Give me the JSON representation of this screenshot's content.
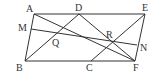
{
  "diagram": {
    "type": "geometry",
    "points": {
      "A": {
        "label": "A",
        "x": 34,
        "y": 14,
        "lx": 26,
        "ly": 12
      },
      "D": {
        "label": "D",
        "x": 79,
        "y": 14,
        "lx": 75,
        "ly": 11
      },
      "E": {
        "label": "E",
        "x": 145,
        "y": 14,
        "lx": 142,
        "ly": 11
      },
      "M": {
        "label": "M",
        "x": 31,
        "y": 29,
        "lx": 18,
        "ly": 31
      },
      "Q": {
        "label": "Q",
        "x": 57,
        "y": 33,
        "lx": 52,
        "ly": 46
      },
      "R": {
        "label": "R",
        "x": 112,
        "y": 42,
        "lx": 106,
        "ly": 38
      },
      "N": {
        "label": "N",
        "x": 137,
        "y": 45,
        "lx": 140,
        "ly": 51
      },
      "B": {
        "label": "B",
        "x": 25,
        "y": 61,
        "lx": 16,
        "ly": 71
      },
      "C": {
        "label": "C",
        "x": 91,
        "y": 61,
        "lx": 86,
        "ly": 71
      },
      "F": {
        "label": "F",
        "x": 135,
        "y": 61,
        "lx": 133,
        "ly": 71
      }
    },
    "segments": [
      [
        "A",
        "E"
      ],
      [
        "B",
        "F"
      ],
      [
        "A",
        "B"
      ],
      [
        "E",
        "F"
      ],
      [
        "A",
        "F"
      ],
      [
        "B",
        "D"
      ],
      [
        "D",
        "F"
      ],
      [
        "C",
        "E"
      ],
      [
        "M",
        "N"
      ]
    ],
    "stroke_color": "#333333"
  }
}
